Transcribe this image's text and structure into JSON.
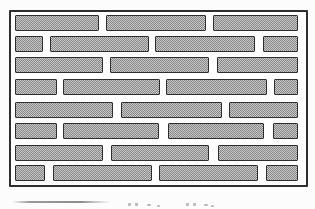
{
  "figure": {
    "name": "brick-wall-pattern",
    "wall": {
      "x": 9,
      "y": 10,
      "width": 299,
      "height": 177,
      "border_color": "#2e2e2e",
      "background": "#ffffff"
    },
    "brick_style": {
      "border_color": "#2e2e2e",
      "fill_dark": "#8a8a8a",
      "fill_light": "#c6c6c6",
      "height": 16
    },
    "row_count": 8,
    "rows": [
      {
        "row": 1,
        "bricks": [
          {
            "x": 4,
            "y": 3,
            "w": 84
          },
          {
            "x": 95,
            "y": 3,
            "w": 100
          },
          {
            "x": 202,
            "y": 3,
            "w": 85
          }
        ]
      },
      {
        "row": 2,
        "bricks": [
          {
            "x": 4,
            "y": 24,
            "w": 28
          },
          {
            "x": 39,
            "y": 24,
            "w": 99
          },
          {
            "x": 144,
            "y": 24,
            "w": 100
          },
          {
            "x": 252,
            "y": 24,
            "w": 35
          }
        ]
      },
      {
        "row": 3,
        "bricks": [
          {
            "x": 4,
            "y": 45,
            "w": 88
          },
          {
            "x": 99,
            "y": 45,
            "w": 99
          },
          {
            "x": 206,
            "y": 45,
            "w": 81
          }
        ]
      },
      {
        "row": 4,
        "bricks": [
          {
            "x": 4,
            "y": 67,
            "w": 42
          },
          {
            "x": 52,
            "y": 67,
            "w": 97
          },
          {
            "x": 155,
            "y": 67,
            "w": 101
          },
          {
            "x": 263,
            "y": 67,
            "w": 24
          }
        ]
      },
      {
        "row": 5,
        "bricks": [
          {
            "x": 4,
            "y": 90,
            "w": 98
          },
          {
            "x": 110,
            "y": 90,
            "w": 101
          },
          {
            "x": 218,
            "y": 90,
            "w": 69
          }
        ]
      },
      {
        "row": 6,
        "bricks": [
          {
            "x": 4,
            "y": 111,
            "w": 42
          },
          {
            "x": 52,
            "y": 111,
            "w": 96
          },
          {
            "x": 157,
            "y": 111,
            "w": 96
          },
          {
            "x": 262,
            "y": 111,
            "w": 25
          }
        ]
      },
      {
        "row": 7,
        "bricks": [
          {
            "x": 4,
            "y": 133,
            "w": 88
          },
          {
            "x": 100,
            "y": 133,
            "w": 98
          },
          {
            "x": 207,
            "y": 133,
            "w": 80
          }
        ]
      },
      {
        "row": 8,
        "bricks": [
          {
            "x": 4,
            "y": 153,
            "w": 30
          },
          {
            "x": 42,
            "y": 153,
            "w": 99
          },
          {
            "x": 148,
            "y": 153,
            "w": 99
          },
          {
            "x": 255,
            "y": 153,
            "w": 32
          }
        ]
      }
    ]
  },
  "caption": {
    "rule": {
      "x": 12,
      "y": 201,
      "w": 98
    },
    "fragments": [
      {
        "x": 128,
        "y": 203,
        "w": 3,
        "h": 3
      },
      {
        "x": 135,
        "y": 203,
        "w": 3,
        "h": 3
      },
      {
        "x": 147,
        "y": 204,
        "w": 4,
        "h": 2
      },
      {
        "x": 157,
        "y": 205,
        "w": 3,
        "h": 2
      },
      {
        "x": 186,
        "y": 203,
        "w": 3,
        "h": 3
      },
      {
        "x": 193,
        "y": 203,
        "w": 3,
        "h": 3
      },
      {
        "x": 204,
        "y": 204,
        "w": 4,
        "h": 2
      },
      {
        "x": 211,
        "y": 205,
        "w": 3,
        "h": 2
      }
    ]
  }
}
